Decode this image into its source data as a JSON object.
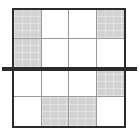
{
  "figure": {
    "name": "shaded-fraction-grid",
    "width": 139,
    "height": 138,
    "background_color": "#ffffff"
  },
  "grid": {
    "rows": 4,
    "columns": 4,
    "total_cells": 16,
    "shaded_count": 6,
    "unshaded_count": 10,
    "shaded_fraction": "6/16",
    "border_color": "#2b2b2b",
    "border_width": 2,
    "inner_line_color": "#9a9a9a",
    "inner_line_width": 1,
    "shaded_color": "#d2d2d2",
    "unshaded_color": "#ffffff",
    "cells": [
      {
        "row": 1,
        "col": 1,
        "shaded": true,
        "label": "row-1-col-1"
      },
      {
        "row": 1,
        "col": 2,
        "shaded": false,
        "label": "row-1-col-2"
      },
      {
        "row": 1,
        "col": 3,
        "shaded": false,
        "label": "row-1-col-3"
      },
      {
        "row": 1,
        "col": 4,
        "shaded": true,
        "label": "row-1-col-4"
      },
      {
        "row": 2,
        "col": 1,
        "shaded": true,
        "label": "row-2-col-1"
      },
      {
        "row": 2,
        "col": 2,
        "shaded": false,
        "label": "row-2-col-2"
      },
      {
        "row": 2,
        "col": 3,
        "shaded": false,
        "label": "row-2-col-3"
      },
      {
        "row": 2,
        "col": 4,
        "shaded": false,
        "label": "row-2-col-4"
      },
      {
        "row": 3,
        "col": 1,
        "shaded": false,
        "label": "row-3-col-1"
      },
      {
        "row": 3,
        "col": 2,
        "shaded": false,
        "label": "row-3-col-2"
      },
      {
        "row": 3,
        "col": 3,
        "shaded": false,
        "label": "row-3-col-3"
      },
      {
        "row": 3,
        "col": 4,
        "shaded": true,
        "label": "row-3-col-4"
      },
      {
        "row": 4,
        "col": 1,
        "shaded": false,
        "label": "row-4-col-1"
      },
      {
        "row": 4,
        "col": 2,
        "shaded": true,
        "label": "row-4-col-2"
      },
      {
        "row": 4,
        "col": 3,
        "shaded": true,
        "label": "row-4-col-3"
      },
      {
        "row": 4,
        "col": 4,
        "shaded": false,
        "label": "row-4-col-4"
      }
    ]
  },
  "cut_line": {
    "orientation": "horizontal",
    "color": "#2b2b2b",
    "thickness": 4,
    "position": "between row 2 and row 3",
    "overhangs_grid": true
  }
}
